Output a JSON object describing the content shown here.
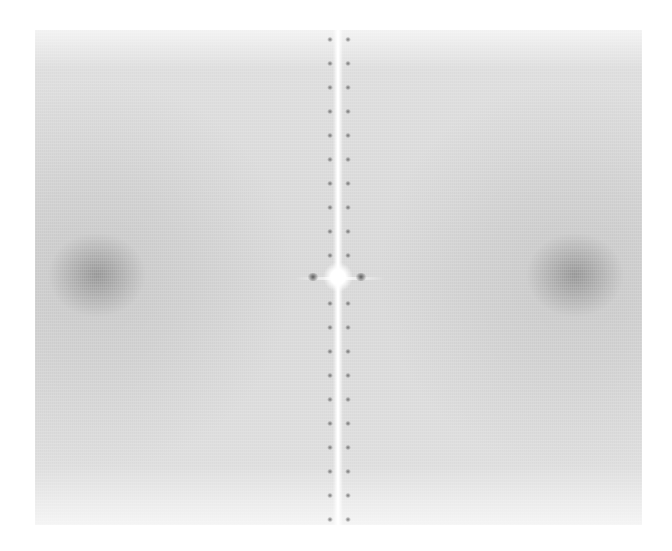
{
  "image": {
    "description": "2D Fourier power spectrum (FFT magnitude) of an image: light gray noisy field with a bright vertical central line, a bright DC center, two diffuse dark spots at left and right, and periodic dark dots along the central line",
    "background_color": "#ffffff",
    "field_color": "#d8d8d8",
    "bright_color": "#ffffff",
    "spot_color": "#6e6e6e",
    "center": {
      "x": 338,
      "y": 277
    },
    "side_spots": [
      {
        "x": 97,
        "y": 277
      },
      {
        "x": 575,
        "y": 277
      }
    ],
    "dot_spacing_px": 24
  }
}
